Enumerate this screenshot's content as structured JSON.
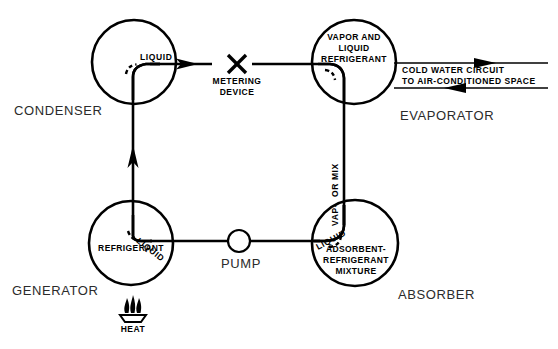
{
  "diagram": {
    "type": "schematic",
    "background_color": "#ffffff",
    "line_color": "#000000",
    "label_color": "#2b2b2b"
  },
  "components": {
    "condenser": {
      "name": "CONDENSER",
      "shape": "circle",
      "cx": 134,
      "cy": 62,
      "r": 42
    },
    "evaporator": {
      "name": "EVAPORATOR",
      "shape": "circle",
      "cx": 354,
      "cy": 62,
      "r": 42,
      "inner_lines": [
        "VAPOR AND",
        "LIQUID",
        "REFRIGERANT"
      ]
    },
    "generator": {
      "name": "GENERATOR",
      "shape": "circle",
      "cx": 131,
      "cy": 243,
      "r": 42,
      "inner_lines": [
        "REFRIGERANT"
      ]
    },
    "absorber": {
      "name": "ABSORBER",
      "shape": "circle",
      "cx": 355,
      "cy": 243,
      "r": 43,
      "inner_lines": [
        "ADSORBENT-",
        "REFRIGERANT",
        "MIXTURE"
      ]
    },
    "pump": {
      "name": "PUMP",
      "shape": "circle",
      "cx": 239,
      "cy": 241,
      "r": 11
    },
    "metering_device": {
      "name_line1": "METERING",
      "name_line2": "DEVICE",
      "symbol": "x-mark",
      "cx": 237,
      "cy": 64
    },
    "heat_source": {
      "name": "HEAT",
      "symbol": "flame-burner",
      "cx": 133,
      "cy": 312,
      "flame_count": 3
    }
  },
  "pipe_labels": {
    "condenser_out": "LIQUID",
    "generator_in": "LIQUID",
    "absorber_in": "LIQUID",
    "absorber_riser": "LIQUID VAP-OR MIX",
    "absorber_riser_parts": [
      "LIQUID",
      "VAP-",
      "OR MIX"
    ]
  },
  "cold_water_circuit": {
    "line1": "COLD  WATER  CIRCUIT",
    "line2": "TO  AIR-CONDITIONED  SPACE",
    "top_arrow_direction": "right",
    "bottom_arrow_direction": "left"
  },
  "flow_arrows": [
    {
      "name": "condenser-to-metering",
      "direction": "right",
      "x": 195,
      "y": 64
    },
    {
      "name": "generator-riser-up",
      "direction": "up",
      "x": 133,
      "y": 150
    }
  ]
}
